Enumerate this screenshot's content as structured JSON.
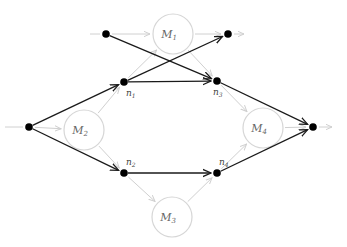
{
  "diagram": {
    "type": "graph",
    "colors": {
      "primary_edge": "#1a1a1a",
      "secondary_edge": "#d0d0d0",
      "node_fill": "#000000",
      "module_stroke": "#d6d6d6",
      "label": "#444444"
    },
    "modules": [
      {
        "id": "M1",
        "label": "M",
        "sub": "1",
        "x": 173,
        "y": 34,
        "r": 20
      },
      {
        "id": "M2",
        "label": "M",
        "sub": "2",
        "x": 84,
        "y": 130,
        "r": 20
      },
      {
        "id": "M3",
        "label": "M",
        "sub": "3",
        "x": 172,
        "y": 217,
        "r": 20
      },
      {
        "id": "M4",
        "label": "M",
        "sub": "4",
        "x": 263,
        "y": 128,
        "r": 20
      }
    ],
    "nodes": [
      {
        "id": "src",
        "x": 29,
        "y": 127
      },
      {
        "id": "top_left",
        "x": 106,
        "y": 34
      },
      {
        "id": "top_right",
        "x": 228,
        "y": 34
      },
      {
        "id": "n1",
        "label": "n",
        "sub": "1",
        "x": 124,
        "y": 82
      },
      {
        "id": "n2",
        "label": "n",
        "sub": "2",
        "x": 124,
        "y": 173
      },
      {
        "id": "n3",
        "label": "n",
        "sub": "3",
        "x": 217,
        "y": 81
      },
      {
        "id": "n4",
        "label": "n",
        "sub": "4",
        "x": 217,
        "y": 173
      },
      {
        "id": "sink",
        "x": 313,
        "y": 127
      }
    ],
    "primary_edges": [
      {
        "from": "src",
        "to": "n1"
      },
      {
        "from": "src",
        "to": "n2"
      },
      {
        "from": "top_left",
        "to": "n3"
      },
      {
        "from": "n1",
        "to": "n3"
      },
      {
        "from": "n1",
        "to": "top_right"
      },
      {
        "from": "n2",
        "to": "n4"
      },
      {
        "from": "n3",
        "to": "sink"
      },
      {
        "from": "n4",
        "to": "sink"
      }
    ],
    "secondary_edges": [
      {
        "from": "src",
        "to": "M2"
      },
      {
        "from": "top_left",
        "to": "M1"
      },
      {
        "from": "M1",
        "to": "top_right"
      },
      {
        "from": "M2",
        "to": "n1"
      },
      {
        "from": "M2",
        "to": "n2"
      },
      {
        "from": "n1",
        "to": "M1"
      },
      {
        "from": "M1",
        "to": "n3"
      },
      {
        "from": "n2",
        "to": "M3"
      },
      {
        "from": "M3",
        "to": "n4"
      },
      {
        "from": "n3",
        "to": "M4"
      },
      {
        "from": "n4",
        "to": "M4"
      },
      {
        "from": "M4",
        "to": "sink"
      }
    ],
    "stubs": [
      {
        "from_x": 5,
        "from_y": 127,
        "to": "src",
        "kind": "in"
      },
      {
        "from_x": 90,
        "from_y": 34,
        "to": "top_left",
        "kind": "in"
      },
      {
        "from": "top_right",
        "to_x": 244,
        "to_y": 34,
        "kind": "out"
      },
      {
        "from": "sink",
        "to_x": 332,
        "to_y": 127,
        "kind": "out"
      }
    ]
  }
}
